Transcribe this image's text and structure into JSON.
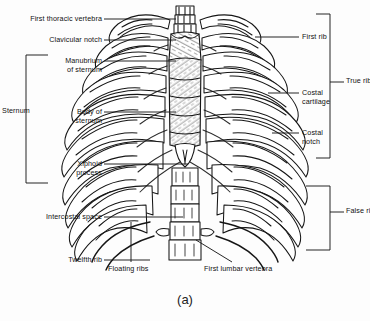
{
  "figure": {
    "caption": "(a)",
    "ink_color": "#1a1a1a",
    "background_color": "#fdfdfd"
  },
  "labels_left": [
    {
      "id": "first-thoracic-vertebra",
      "text": "First thoracic vertebra",
      "x": 4,
      "y": 15,
      "line_x1": 104,
      "line_x2": 176,
      "line_y": 19
    },
    {
      "id": "clavicular-notch",
      "text": "Clavicular notch",
      "x": 29,
      "y": 36,
      "line_x1": 104,
      "line_x2": 176,
      "line_y": 40
    },
    {
      "id": "manubrium-of-sternum",
      "text": "Manubrium\nof sternum",
      "x": 45,
      "y": 57,
      "line_x1": 104,
      "line_x2": 176,
      "line_y": 61
    },
    {
      "id": "body-of-sternum",
      "text": "Body of\nsternum",
      "x": 60,
      "y": 108,
      "line_x1": 104,
      "line_x2": 176,
      "line_y": 112
    },
    {
      "id": "xiphoid-process",
      "text": "Xiphoid\nprocess",
      "x": 53,
      "y": 160,
      "line_x1": 104,
      "line_x2": 188,
      "line_y": 164
    },
    {
      "id": "intercostal-space",
      "text": "Intercostal space",
      "x": 20,
      "y": 213,
      "line_x1": 104,
      "line_x2": 183,
      "line_y": 217
    },
    {
      "id": "twelfth-rib",
      "text": "Twelfth rib",
      "x": 48,
      "y": 256,
      "line_x1": 104,
      "line_x2": 150,
      "line_y": 260
    }
  ],
  "labels_right": [
    {
      "id": "first-rib",
      "text": "First rib",
      "x": 302,
      "y": 33,
      "line_x1": 255,
      "line_x2": 299,
      "line_y": 37
    },
    {
      "id": "costal-cartilage",
      "text": "Costal\ncartilage",
      "x": 302,
      "y": 89,
      "line_x1": 268,
      "line_x2": 299,
      "line_y": 93
    },
    {
      "id": "costal-notch",
      "text": "Costal\nnotch",
      "x": 302,
      "y": 129,
      "line_x1": 270,
      "line_x2": 299,
      "line_y": 133
    }
  ],
  "labels_bottom": [
    {
      "id": "floating-ribs",
      "text": "Floating ribs",
      "x": 112,
      "y": 268
    },
    {
      "id": "first-lumbar-vertebra",
      "text": "First lumbar vertebra",
      "x": 205,
      "y": 268
    }
  ],
  "brackets": [
    {
      "id": "sternum-bracket",
      "label": "Sternum",
      "side": "left",
      "x": 26,
      "y_top": 55,
      "y_bottom": 183,
      "arm": 22,
      "label_x": 4,
      "label_y": 111
    },
    {
      "id": "true-ribs-bracket",
      "label": "True ribs",
      "side": "right",
      "x": 330,
      "y_top": 14,
      "y_bottom": 158,
      "arm": 14,
      "label_x": 347,
      "label_y": 82
    },
    {
      "id": "false-ribs-bracket",
      "label": "False ribs",
      "side": "right",
      "x": 330,
      "y_top": 186,
      "y_bottom": 250,
      "arm": 14,
      "label_x": 347,
      "label_y": 212
    }
  ]
}
